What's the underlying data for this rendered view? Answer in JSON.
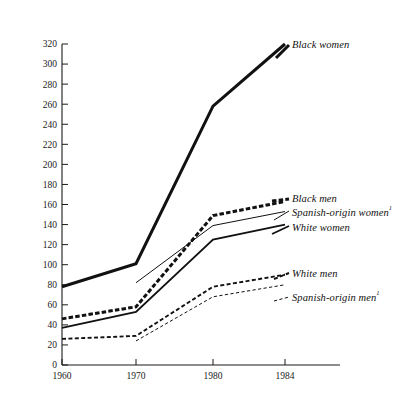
{
  "chart_data": {
    "type": "line",
    "title": "",
    "subtitle": "",
    "xlabel": "",
    "ylabel": "",
    "x": [
      1960,
      1970,
      1980,
      1984
    ],
    "xtick_labels": [
      "1960",
      "1970",
      "1980",
      "1984"
    ],
    "xlim": [
      1960,
      1984
    ],
    "ylim": [
      0,
      320
    ],
    "ytick_labels": [
      "0",
      "20",
      "40",
      "60",
      "80",
      "100",
      "120",
      "140",
      "160",
      "180",
      "200",
      "220",
      "240",
      "260",
      "280",
      "300",
      "320"
    ],
    "ytick_values": [
      0,
      20,
      40,
      60,
      80,
      100,
      120,
      140,
      160,
      180,
      200,
      220,
      240,
      260,
      280,
      300,
      320
    ],
    "grid": false,
    "legend_position": "right-inline",
    "series": [
      {
        "name": "Black women",
        "label": "Black women",
        "footnote_marker": "",
        "style": "thick-solid",
        "x": [
          1960,
          1970,
          1980,
          1984
        ],
        "values": [
          78,
          101,
          258,
          320
        ]
      },
      {
        "name": "Black men",
        "label": "Black men",
        "footnote_marker": "",
        "style": "thick-dashed",
        "x": [
          1960,
          1970,
          1980,
          1984
        ],
        "values": [
          46,
          58,
          149,
          163
        ]
      },
      {
        "name": "Spanish-origin women",
        "label": "Spanish-origin women",
        "footnote_marker": "1",
        "style": "thin-solid",
        "x": [
          1970,
          1980,
          1984
        ],
        "values": [
          82,
          139,
          153
        ]
      },
      {
        "name": "White women",
        "label": "White women",
        "footnote_marker": "",
        "style": "medium-solid",
        "x": [
          1960,
          1970,
          1980,
          1984
        ],
        "values": [
          37,
          53,
          125,
          140
        ]
      },
      {
        "name": "White men",
        "label": "White men",
        "footnote_marker": "",
        "style": "medium-dashed",
        "x": [
          1960,
          1970,
          1980,
          1984
        ],
        "values": [
          26,
          29,
          78,
          90
        ]
      },
      {
        "name": "Spanish-origin men",
        "label": "Spanish-origin men",
        "footnote_marker": "1",
        "style": "thin-dashed",
        "x": [
          1970,
          1980,
          1984
        ],
        "values": [
          24,
          68,
          80
        ]
      }
    ]
  },
  "axis": {
    "y_ticks": [
      "0",
      "20",
      "40",
      "60",
      "80",
      "100",
      "120",
      "140",
      "160",
      "180",
      "200",
      "220",
      "240",
      "260",
      "280",
      "300",
      "320"
    ],
    "x_ticks": [
      "1960",
      "1970",
      "1980",
      "1984"
    ]
  },
  "legend": {
    "entries": [
      {
        "label": "Black women",
        "sup": ""
      },
      {
        "label": "Black men",
        "sup": ""
      },
      {
        "label": "Spanish-origin women",
        "sup": "1"
      },
      {
        "label": "White women",
        "sup": ""
      },
      {
        "label": "White men",
        "sup": ""
      },
      {
        "label": "Spanish-origin men",
        "sup": "1"
      }
    ]
  },
  "colors": {
    "ink": "#111111",
    "background": "#ffffff"
  }
}
